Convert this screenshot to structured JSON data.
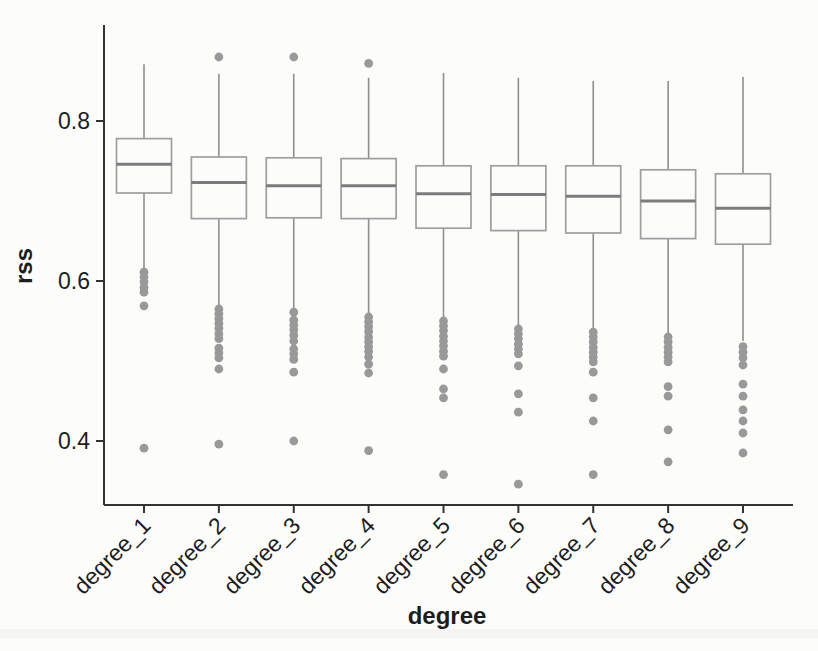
{
  "figure": {
    "background": "#fcfcfb",
    "axis_color": "#333333",
    "box_color": "#9e9e9e",
    "median_color": "#7c7c7c",
    "whisker_color": "#8f8f8f",
    "outlier_color": "#999999",
    "text_color": "#1d1d1d"
  },
  "chart_data": {
    "type": "boxplot",
    "title": "",
    "xlabel": "degree",
    "ylabel": "rss",
    "legend": "none",
    "grid": false,
    "ylim": [
      0.32,
      0.92
    ],
    "y_ticks": [
      0.4,
      0.6,
      0.8
    ],
    "categories": [
      "degree_1",
      "degree_2",
      "degree_3",
      "degree_4",
      "degree_5",
      "degree_6",
      "degree_7",
      "degree_8",
      "degree_9"
    ],
    "series": [
      {
        "label": "degree_1",
        "whisker_low": 0.615,
        "q1": 0.71,
        "median": 0.746,
        "q3": 0.778,
        "whisker_high": 0.871,
        "outliers": [
          0.611,
          0.605,
          0.599,
          0.592,
          0.586,
          0.569,
          0.391
        ]
      },
      {
        "label": "degree_2",
        "whisker_low": 0.569,
        "q1": 0.678,
        "median": 0.723,
        "q3": 0.755,
        "whisker_high": 0.859,
        "outliers": [
          0.88,
          0.565,
          0.559,
          0.553,
          0.547,
          0.541,
          0.534,
          0.528,
          0.516,
          0.51,
          0.504,
          0.49,
          0.396
        ]
      },
      {
        "label": "degree_3",
        "whisker_low": 0.566,
        "q1": 0.679,
        "median": 0.719,
        "q3": 0.754,
        "whisker_high": 0.859,
        "outliers": [
          0.88,
          0.561,
          0.551,
          0.545,
          0.539,
          0.532,
          0.525,
          0.515,
          0.509,
          0.502,
          0.486,
          0.4
        ]
      },
      {
        "label": "degree_4",
        "whisker_low": 0.559,
        "q1": 0.678,
        "median": 0.719,
        "q3": 0.753,
        "whisker_high": 0.854,
        "outliers": [
          0.872,
          0.555,
          0.549,
          0.543,
          0.537,
          0.53,
          0.524,
          0.518,
          0.512,
          0.505,
          0.496,
          0.485,
          0.388
        ]
      },
      {
        "label": "degree_5",
        "whisker_low": 0.554,
        "q1": 0.666,
        "median": 0.709,
        "q3": 0.744,
        "whisker_high": 0.86,
        "outliers": [
          0.55,
          0.544,
          0.538,
          0.531,
          0.525,
          0.519,
          0.512,
          0.506,
          0.49,
          0.465,
          0.454,
          0.358
        ]
      },
      {
        "label": "degree_6",
        "whisker_low": 0.543,
        "q1": 0.663,
        "median": 0.708,
        "q3": 0.744,
        "whisker_high": 0.854,
        "outliers": [
          0.54,
          0.534,
          0.528,
          0.521,
          0.515,
          0.509,
          0.494,
          0.459,
          0.436,
          0.346
        ]
      },
      {
        "label": "degree_7",
        "whisker_low": 0.54,
        "q1": 0.66,
        "median": 0.706,
        "q3": 0.744,
        "whisker_high": 0.85,
        "outliers": [
          0.536,
          0.53,
          0.524,
          0.517,
          0.511,
          0.505,
          0.499,
          0.486,
          0.454,
          0.425,
          0.358
        ]
      },
      {
        "label": "degree_8",
        "whisker_low": 0.534,
        "q1": 0.653,
        "median": 0.7,
        "q3": 0.739,
        "whisker_high": 0.85,
        "outliers": [
          0.53,
          0.524,
          0.517,
          0.511,
          0.505,
          0.499,
          0.468,
          0.456,
          0.414,
          0.374
        ]
      },
      {
        "label": "degree_9",
        "whisker_low": 0.525,
        "q1": 0.646,
        "median": 0.691,
        "q3": 0.734,
        "whisker_high": 0.855,
        "outliers": [
          0.518,
          0.511,
          0.504,
          0.495,
          0.471,
          0.456,
          0.439,
          0.425,
          0.41,
          0.385
        ]
      }
    ]
  }
}
